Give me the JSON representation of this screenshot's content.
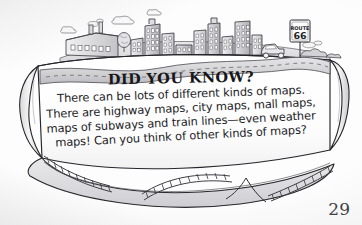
{
  "page": {
    "number": "29",
    "kind": "childrens-book-illustrated-page",
    "background_color": "#fdfdfd",
    "ink_color": "#17171a"
  },
  "scroll_panel": {
    "title": "DID YOU KNOW?",
    "body_lines": [
      "There can be lots of different kinds of maps.",
      "There are highway maps, city maps, mall maps,",
      "maps of subways and train lines—even weather",
      "maps! Can you think of other kinds of maps?"
    ],
    "full_text": "There can be lots of different kinds of maps. There are highway maps, city maps, mall maps, maps of subways and train lines—even weather maps! Can you think of other kinds of maps?"
  },
  "illustration": {
    "style": "hand-drawn pencil and ink, grayscale",
    "scene_label": "cityscape-with-scroll-banner",
    "elements": [
      {
        "name": "factory-building",
        "label": "factory with smokestacks"
      },
      {
        "name": "city-buildings",
        "label": "row of city buildings"
      },
      {
        "name": "smoke-puffs",
        "label": "smoke puffs"
      },
      {
        "name": "cloud",
        "label": "cloud"
      },
      {
        "name": "tree",
        "label": "tree"
      },
      {
        "name": "winding-road",
        "label": "winding highway"
      },
      {
        "name": "car",
        "label": "car on the road"
      },
      {
        "name": "road-sign",
        "label": "Route 66 highway sign"
      },
      {
        "name": "bushes",
        "label": "roadside bushes"
      },
      {
        "name": "railroad-track",
        "label": "railroad track along bottom"
      },
      {
        "name": "scroll-curl-left",
        "label": "left curled scroll edge"
      },
      {
        "name": "scroll-curl-right",
        "label": "right curled scroll edge"
      }
    ],
    "road_sign": {
      "top_text": "ROUTE",
      "number": "66"
    }
  }
}
